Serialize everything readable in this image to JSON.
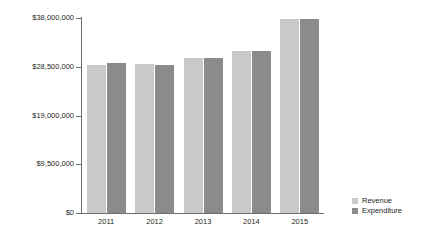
{
  "chart_data": {
    "type": "bar",
    "title": "",
    "subtitle": "",
    "xlabel": "",
    "ylabel": "",
    "categories": [
      "2011",
      "2012",
      "2013",
      "2014",
      "2015"
    ],
    "series": [
      {
        "name": "Revenue",
        "values": [
          28900000,
          29100000,
          30200000,
          31600000,
          37900000
        ],
        "color": "#c9c9c9"
      },
      {
        "name": "Expenditure",
        "values": [
          29300000,
          28900000,
          30300000,
          31600000,
          37900000
        ],
        "color": "#8b8b8b"
      }
    ],
    "ylim": [
      0,
      38000000
    ],
    "ytick_labels": [
      "$38,000,000",
      "$28,500,000",
      "$19,000,000",
      "$9,500,000",
      "$0"
    ],
    "ytick_values": [
      38000000,
      28500000,
      19000000,
      9500000,
      0
    ],
    "grid": false,
    "legend_position": "right-bottom",
    "legend_entries": [
      "Revenue",
      "Expenditure"
    ],
    "axis_color": "#6d6e71",
    "background": "#ffffff"
  }
}
